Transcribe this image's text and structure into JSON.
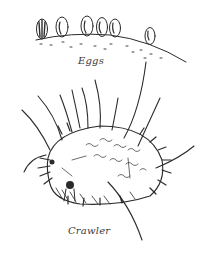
{
  "illustration": {
    "style": "pen-and-ink line drawing",
    "ink_color": "#2b2b2b",
    "background_color": "#ffffff",
    "panels": [
      {
        "id": "eggs",
        "label": "Eggs",
        "description": "Row of six oval eggs resting on a sloped leaf/bark surface"
      },
      {
        "id": "crawler",
        "label": "Crawler",
        "description": "Oval, spiny first-instar crawler with long bristles and textured dorsal surface"
      }
    ]
  }
}
